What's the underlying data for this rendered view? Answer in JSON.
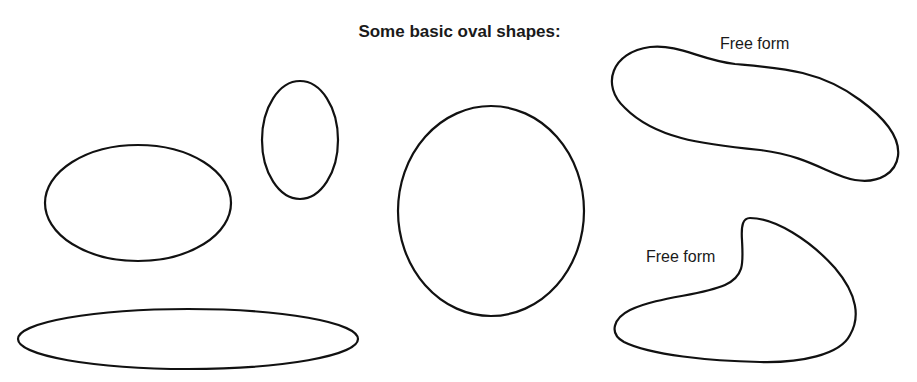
{
  "title": "Some basic oval shapes:",
  "labels": {
    "free_form_top": "Free form",
    "free_form_bottom": "Free form"
  },
  "shapes": [
    {
      "name": "horizontal-ellipse",
      "type": "ellipse",
      "cx": 138,
      "cy": 203,
      "rx": 93,
      "ry": 58
    },
    {
      "name": "vertical-ellipse",
      "type": "ellipse",
      "cx": 300,
      "cy": 140,
      "rx": 38,
      "ry": 59
    },
    {
      "name": "large-oval",
      "type": "ellipse",
      "cx": 491,
      "cy": 211,
      "rx": 93,
      "ry": 105
    },
    {
      "name": "flat-ellipse",
      "type": "ellipse",
      "cx": 188,
      "cy": 339,
      "rx": 170,
      "ry": 30
    },
    {
      "name": "free-form-top",
      "type": "path"
    },
    {
      "name": "free-form-bottom",
      "type": "path"
    }
  ],
  "colors": {
    "stroke": "#111111",
    "background": "#ffffff",
    "text": "#1a1a1a"
  }
}
